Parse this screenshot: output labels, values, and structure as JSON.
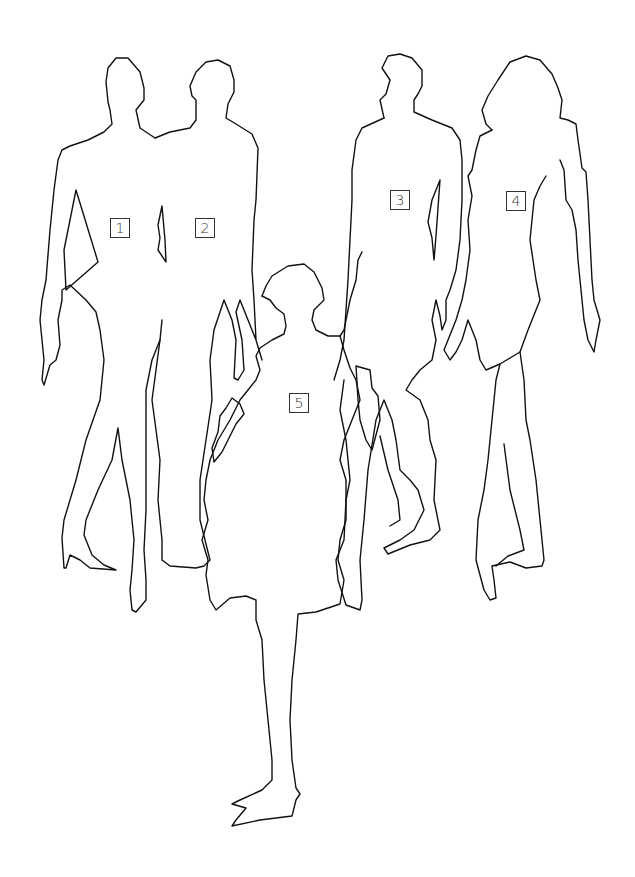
{
  "illustration": {
    "description": "Line drawing of five fashion figure silhouettes",
    "stroke_color": "#111111",
    "background_color": "#ffffff",
    "figures": [
      {
        "id": 1,
        "label": "1",
        "label_pos": {
          "x": 110,
          "y": 218
        }
      },
      {
        "id": 2,
        "label": "2",
        "label_pos": {
          "x": 195,
          "y": 218
        }
      },
      {
        "id": 3,
        "label": "3",
        "label_pos": {
          "x": 390,
          "y": 190
        }
      },
      {
        "id": 4,
        "label": "4",
        "label_pos": {
          "x": 506,
          "y": 191
        }
      },
      {
        "id": 5,
        "label": "5",
        "label_pos": {
          "x": 289,
          "y": 393
        }
      }
    ]
  }
}
